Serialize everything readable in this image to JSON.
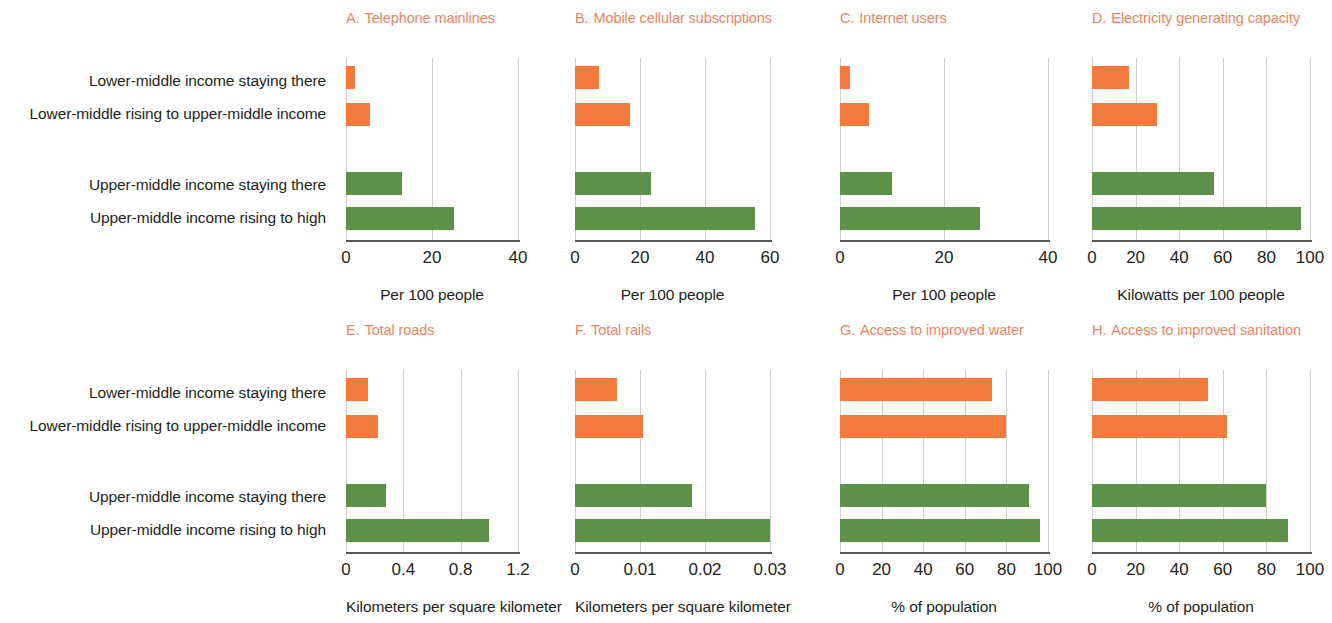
{
  "categories": [
    "Lower-middle income staying there",
    "Lower-middle rising to upper-middle income",
    "Upper-middle income staying there",
    "Upper-middle income rising to high"
  ],
  "colors": {
    "orange": "#f4793c",
    "green": "#5d9149",
    "title": "#ef8362",
    "axis": "#58585a",
    "grid": "#cfcfcf",
    "text": "#231f20"
  },
  "chart_data": [
    {
      "type": "bar",
      "panel": "A",
      "letter": "A.",
      "title": "Telephone mainlines",
      "orientation": "horizontal",
      "categories": [
        "Lower-middle income staying there",
        "Lower-middle rising to upper-middle income",
        "Upper-middle income staying there",
        "Upper-middle income rising to high"
      ],
      "values": [
        2,
        5.5,
        13,
        25
      ],
      "colors": [
        "#f4793c",
        "#f4793c",
        "#5d9149",
        "#5d9149"
      ],
      "xlabel": "Per 100 people",
      "ylabel": "",
      "xlim": [
        0,
        40
      ],
      "xticks": [
        0,
        20,
        40
      ],
      "xticklabels": [
        "0",
        "20",
        "40"
      ],
      "grid": true,
      "legend": "none"
    },
    {
      "type": "bar",
      "panel": "B",
      "letter": "B.",
      "title": "Mobile cellular subscriptions",
      "orientation": "horizontal",
      "categories": [
        "Lower-middle income staying there",
        "Lower-middle rising to upper-middle income",
        "Upper-middle income staying there",
        "Upper-middle income rising to high"
      ],
      "values": [
        7.5,
        17,
        23.5,
        55.5
      ],
      "colors": [
        "#f4793c",
        "#f4793c",
        "#5d9149",
        "#5d9149"
      ],
      "xlabel": "Per 100 people",
      "ylabel": "",
      "xlim": [
        0,
        60
      ],
      "xticks": [
        0,
        20,
        40,
        60
      ],
      "xticklabels": [
        "0",
        "20",
        "40",
        "60"
      ],
      "grid": true,
      "legend": "none"
    },
    {
      "type": "bar",
      "panel": "C",
      "letter": "C.",
      "title": "Internet users",
      "orientation": "horizontal",
      "categories": [
        "Lower-middle income staying there",
        "Lower-middle rising to upper-middle income",
        "Upper-middle income staying there",
        "Upper-middle income rising to high"
      ],
      "values": [
        2,
        5.5,
        10,
        27
      ],
      "colors": [
        "#f4793c",
        "#f4793c",
        "#5d9149",
        "#5d9149"
      ],
      "xlabel": "Per 100 people",
      "ylabel": "",
      "xlim": [
        0,
        40
      ],
      "xticks": [
        0,
        20,
        40
      ],
      "xticklabels": [
        "0",
        "20",
        "40"
      ],
      "grid": true,
      "legend": "none"
    },
    {
      "type": "bar",
      "panel": "D",
      "letter": "D.",
      "title": "Electricity generating capacity",
      "orientation": "horizontal",
      "categories": [
        "Lower-middle income staying there",
        "Lower-middle rising to upper-middle income",
        "Upper-middle income staying there",
        "Upper-middle income rising to high"
      ],
      "values": [
        17,
        30,
        56,
        96
      ],
      "colors": [
        "#f4793c",
        "#f4793c",
        "#5d9149",
        "#5d9149"
      ],
      "xlabel": "Kilowatts per 100 people",
      "ylabel": "",
      "xlim": [
        0,
        100
      ],
      "xticks": [
        0,
        20,
        40,
        60,
        80,
        100
      ],
      "xticklabels": [
        "0",
        "20",
        "40",
        "60",
        "80",
        "100"
      ],
      "grid": true,
      "legend": "none"
    },
    {
      "type": "bar",
      "panel": "E",
      "letter": "E.",
      "title": "Total roads",
      "orientation": "horizontal",
      "categories": [
        "Lower-middle income staying there",
        "Lower-middle rising to upper-middle income",
        "Upper-middle income staying there",
        "Upper-middle income rising to high"
      ],
      "values": [
        0.15,
        0.22,
        0.28,
        1.0
      ],
      "colors": [
        "#f4793c",
        "#f4793c",
        "#5d9149",
        "#5d9149"
      ],
      "xlabel": "Kilometers per square kilometer",
      "ylabel": "",
      "xlim": [
        0,
        1.2
      ],
      "xticks": [
        0,
        0.4,
        0.8,
        1.2
      ],
      "xticklabels": [
        "0",
        "0.4",
        "0.8",
        "1.2"
      ],
      "grid": true,
      "legend": "none"
    },
    {
      "type": "bar",
      "panel": "F",
      "letter": "F.",
      "title": "Total rails",
      "orientation": "horizontal",
      "categories": [
        "Lower-middle income staying there",
        "Lower-middle rising to upper-middle income",
        "Upper-middle income staying there",
        "Upper-middle income rising to high"
      ],
      "values": [
        0.0065,
        0.0105,
        0.018,
        0.03
      ],
      "colors": [
        "#f4793c",
        "#f4793c",
        "#5d9149",
        "#5d9149"
      ],
      "xlabel": "Kilometers per square kilometer",
      "ylabel": "",
      "xlim": [
        0,
        0.03
      ],
      "xticks": [
        0,
        0.01,
        0.02,
        0.03
      ],
      "xticklabels": [
        "0",
        "0.01",
        "0.02",
        "0.03"
      ],
      "grid": true,
      "legend": "none"
    },
    {
      "type": "bar",
      "panel": "G",
      "letter": "G.",
      "title": "Access to improved water",
      "orientation": "horizontal",
      "categories": [
        "Lower-middle income staying there",
        "Lower-middle rising to upper-middle income",
        "Upper-middle income staying there",
        "Upper-middle income rising to high"
      ],
      "values": [
        73,
        80,
        91,
        96
      ],
      "colors": [
        "#f4793c",
        "#f4793c",
        "#5d9149",
        "#5d9149"
      ],
      "xlabel": "% of population",
      "ylabel": "",
      "xlim": [
        0,
        100
      ],
      "xticks": [
        0,
        20,
        40,
        60,
        80,
        100
      ],
      "xticklabels": [
        "0",
        "20",
        "40",
        "60",
        "80",
        "100"
      ],
      "grid": true,
      "legend": "none"
    },
    {
      "type": "bar",
      "panel": "H",
      "letter": "H.",
      "title": "Access to improved sanitation",
      "orientation": "horizontal",
      "categories": [
        "Lower-middle income staying there",
        "Lower-middle rising to upper-middle income",
        "Upper-middle income staying there",
        "Upper-middle income rising to high"
      ],
      "values": [
        53,
        62,
        80,
        90
      ],
      "colors": [
        "#f4793c",
        "#f4793c",
        "#5d9149",
        "#5d9149"
      ],
      "xlabel": "% of population",
      "ylabel": "",
      "xlim": [
        0,
        100
      ],
      "xticks": [
        0,
        20,
        40,
        60,
        80,
        100
      ],
      "xticklabels": [
        "0",
        "20",
        "40",
        "60",
        "80",
        "100"
      ],
      "grid": true,
      "legend": "none"
    }
  ]
}
